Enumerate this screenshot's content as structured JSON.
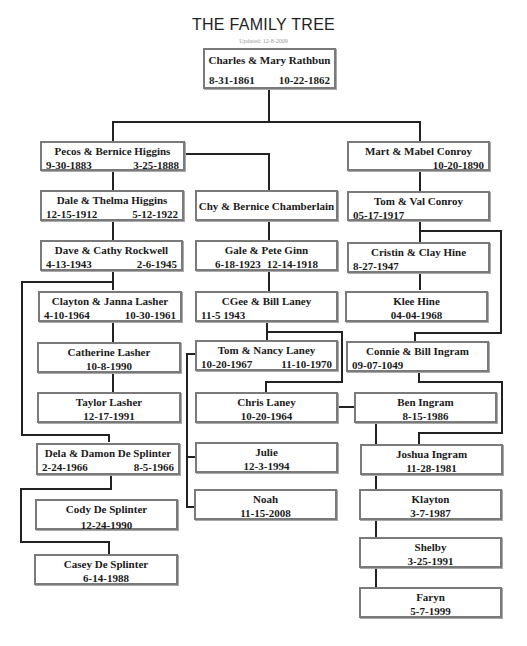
{
  "header": {
    "title": "THE FAMILY TREE",
    "updated": "Updated: 12-8-2009"
  },
  "people": {
    "rathbun": {
      "name": "Charles & Mary Rathbun",
      "date1": "8-31-1861",
      "date2": "10-22-1862"
    },
    "higgins_pecos": {
      "name": "Pecos & Bernice Higgins",
      "date1": "9-30-1883",
      "date2": "3-25-1888"
    },
    "conroy_mart": {
      "name": "Mart & Mabel Conroy",
      "date1": "",
      "date2": "10-20-1890"
    },
    "higgins_dale": {
      "name": "Dale & Thelma Higgins",
      "date1": "12-15-1912",
      "date2": "5-12-1922"
    },
    "chamberlain": {
      "name": "Chy & Bernice Chamberlain"
    },
    "conroy_tom": {
      "name": "Tom & Val Conroy",
      "date1": "05-17-1917"
    },
    "rockwell": {
      "name": "Dave & Cathy Rockwell",
      "date1": "4-13-1943",
      "date2": "2-6-1945"
    },
    "ginn": {
      "name": "Gale & Pete Ginn",
      "date1": "6-18-1923",
      "date2": "12-14-1918"
    },
    "hine_cristin": {
      "name": "Cristin & Clay Hine",
      "date1": "8-27-1947"
    },
    "lasher_clayton": {
      "name": "Clayton & Janna Lasher",
      "date1": "4-10-1964",
      "date2": "10-30-1961"
    },
    "laney_cgee": {
      "name": "CGee & Bill Laney",
      "date1": "11-5 1943"
    },
    "hine_klee": {
      "name": "Klee Hine",
      "date1": "04-04-1968"
    },
    "lasher_catherine": {
      "name": "Catherine Lasher",
      "date1": "10-8-1990"
    },
    "laney_tom": {
      "name": "Tom & Nancy Laney",
      "date1": "10-20-1967",
      "date2": "11-10-1970"
    },
    "ingram_connie": {
      "name": "Connie & Bill Ingram",
      "date1": "09-07-1049"
    },
    "lasher_taylor": {
      "name": "Taylor Lasher",
      "date1": "12-17-1991"
    },
    "laney_chris": {
      "name": "Chris Laney",
      "date1": "10-20-1964"
    },
    "ingram_ben": {
      "name": "Ben Ingram",
      "date1": "8-15-1986"
    },
    "desplinter_dela": {
      "name": "Dela & Damon De Splinter",
      "date1": "2-24-1966",
      "date2": "8-5-1966"
    },
    "julie": {
      "name": "Julie",
      "date1": "12-3-1994"
    },
    "ingram_joshua": {
      "name": "Joshua Ingram",
      "date1": "11-28-1981"
    },
    "desplinter_cody": {
      "name": "Cody De Splinter",
      "date1": "12-24-1990"
    },
    "noah": {
      "name": "Noah",
      "date1": "11-15-2008"
    },
    "klayton": {
      "name": "Klayton",
      "date1": "3-7-1987"
    },
    "shelby": {
      "name": "Shelby",
      "date1": "3-25-1991"
    },
    "desplinter_casey": {
      "name": "Casey De Splinter",
      "date1": "6-14-1988"
    },
    "faryn": {
      "name": "Faryn",
      "date1": "5-7-1999"
    }
  }
}
